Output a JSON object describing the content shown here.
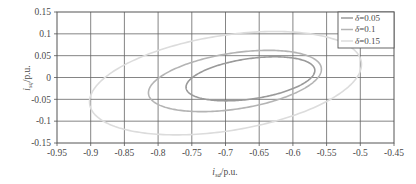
{
  "chart_data": {
    "type": "line",
    "title": "",
    "xlabel": "i_sd/p.u.",
    "xlabel_parts": {
      "var": "i",
      "sub": "sd",
      "unit": "/p.u."
    },
    "ylabel": "i_sq/p.u.",
    "ylabel_parts": {
      "var": "i",
      "sub": "sq",
      "unit": "/p.u."
    },
    "xlim": [
      -0.95,
      -0.45
    ],
    "ylim": [
      -0.15,
      0.15
    ],
    "xticks": [
      "-0.95",
      "-0.9",
      "-0.85",
      "-0.8",
      "-0.75",
      "-0.7",
      "-0.65",
      "-0.6",
      "-0.55",
      "-0.5",
      "-0.45"
    ],
    "xtick_values": [
      -0.95,
      -0.9,
      -0.85,
      -0.8,
      -0.75,
      -0.7,
      -0.65,
      -0.6,
      -0.55,
      -0.5,
      -0.45
    ],
    "yticks": [
      "0.15",
      "0.1",
      "0.05",
      "0",
      "-0.05",
      "-0.1",
      "-0.15"
    ],
    "ytick_values": [
      0.15,
      0.1,
      0.05,
      0,
      -0.05,
      -0.1,
      -0.15
    ],
    "grid": true,
    "legend_position": "top-right",
    "series": [
      {
        "name": "delta=0.05",
        "label_symbol": "δ",
        "label_value": "=0.05",
        "label": "δ=0.05",
        "color": "#9a9a9a",
        "shape": "ellipse",
        "center": [
          -0.663,
          -0.003
        ],
        "semi_major": 0.098,
        "semi_minor": 0.0455,
        "rotation_deg": 14.5,
        "points_x": [
          -0.566,
          -0.592,
          -0.627,
          -0.663,
          -0.7,
          -0.735,
          -0.761,
          -0.76,
          -0.734,
          -0.699,
          -0.663,
          -0.627,
          -0.593,
          -0.567
        ],
        "points_y": [
          -0.022,
          0.012,
          0.038,
          0.049,
          0.044,
          0.026,
          -0.005,
          0.016,
          -0.019,
          -0.042,
          -0.053,
          -0.049,
          -0.031,
          0.0
        ]
      },
      {
        "name": "delta=0.1",
        "label_symbol": "δ",
        "label_value": "=0.1",
        "label": "δ=0.1",
        "color": "#b4b4b4",
        "shape": "ellipse",
        "center": [
          -0.686,
          -0.008
        ],
        "semi_major": 0.132,
        "semi_minor": 0.063,
        "rotation_deg": 15.5,
        "points_x": [
          -0.558,
          -0.592,
          -0.64,
          -0.688,
          -0.736,
          -0.784,
          -0.818,
          -0.816,
          -0.781,
          -0.733,
          -0.685,
          -0.637,
          -0.591,
          -0.558
        ],
        "points_y": [
          -0.027,
          0.018,
          0.052,
          0.069,
          0.063,
          0.036,
          -0.008,
          0.02,
          -0.034,
          -0.066,
          -0.083,
          -0.077,
          -0.051,
          -0.007
        ]
      },
      {
        "name": "delta=0.15",
        "label_symbol": "δ",
        "label_value": "=0.15",
        "label": "δ=0.15",
        "color": "#dcdcdc",
        "shape": "ellipse",
        "center": [
          -0.7,
          -0.013
        ],
        "semi_major": 0.208,
        "semi_minor": 0.107,
        "rotation_deg": 16.5,
        "points_x": [
          -0.5,
          -0.548,
          -0.623,
          -0.7,
          -0.776,
          -0.851,
          -0.899,
          -0.898,
          -0.846,
          -0.77,
          -0.694,
          -0.62,
          -0.549,
          -0.501
        ],
        "points_y": [
          -0.048,
          0.026,
          0.08,
          0.108,
          0.101,
          0.06,
          -0.01,
          0.03,
          -0.057,
          -0.108,
          -0.132,
          -0.123,
          -0.083,
          -0.014
        ]
      }
    ]
  },
  "axes": {
    "frame_color": "#555555",
    "grid_color": "#666666",
    "tick_label_color": "#4a4a4a"
  },
  "legend": {
    "border_color": "#555555",
    "background": "#ffffff",
    "entries": [
      {
        "symbol": "δ",
        "value": "=0.05",
        "color": "#9a9a9a"
      },
      {
        "symbol": "δ",
        "value": "=0.1",
        "color": "#b4b4b4"
      },
      {
        "symbol": "δ",
        "value": "=0.15",
        "color": "#dcdcdc"
      }
    ]
  }
}
